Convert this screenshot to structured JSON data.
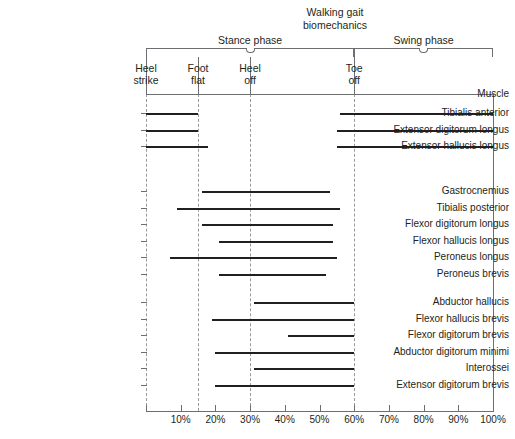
{
  "chart_data": {
    "type": "bar",
    "title": "Walking gait\nbiomechanics",
    "xlabel": "",
    "ylabel": "Muscle",
    "xlim": [
      0,
      100
    ],
    "grid": true,
    "legend": "none",
    "orientation": "horizontal-span",
    "xticks": [
      {
        "value": 10,
        "label": "10%"
      },
      {
        "value": 20,
        "label": "20%"
      },
      {
        "value": 30,
        "label": "30%"
      },
      {
        "value": 40,
        "label": "40%"
      },
      {
        "value": 50,
        "label": "50%"
      },
      {
        "value": 60,
        "label": "60%"
      },
      {
        "value": 70,
        "label": "70%"
      },
      {
        "value": 80,
        "label": "80%"
      },
      {
        "value": 90,
        "label": "90%"
      },
      {
        "value": 100,
        "label": "100%"
      }
    ],
    "phases": [
      {
        "name": "Stance phase",
        "start": 0,
        "end": 60
      },
      {
        "name": "Swing phase",
        "start": 60,
        "end": 100
      }
    ],
    "events": [
      {
        "name": "Heel\nstrike",
        "value": 0
      },
      {
        "name": "Foot\nflat",
        "value": 15
      },
      {
        "name": "Heel\noff",
        "value": 30
      },
      {
        "name": "Toe\noff",
        "value": 60
      }
    ],
    "categories": [
      "Tibialis anterior",
      "Extensor digitorum longus",
      "Extensor hallucis longus",
      "Gastrocnemius",
      "Tibialis posterior",
      "Flexor digitorum longus",
      "Flexor hallucis longus",
      "Peroneus longus",
      "Peroneus brevis",
      "Abductor hallucis",
      "Flexor hallucis brevis",
      "Flexor digitorum brevis",
      "Abductor digitorum minimi",
      "Interossei",
      "Extensor digitorum brevis"
    ],
    "groups": [
      {
        "name": "anterior-compartment",
        "rows": [
          {
            "label": "Tibialis anterior",
            "spans": [
              [
                0,
                15
              ],
              [
                56,
                100
              ]
            ]
          },
          {
            "label": "Extensor digitorum longus",
            "spans": [
              [
                0,
                15
              ],
              [
                55,
                100
              ]
            ]
          },
          {
            "label": "Extensor hallucis longus",
            "spans": [
              [
                0,
                18
              ],
              [
                55,
                100
              ]
            ]
          }
        ]
      },
      {
        "name": "posterior-lateral-compartment",
        "rows": [
          {
            "label": "Gastrocnemius",
            "spans": [
              [
                16,
                53
              ]
            ]
          },
          {
            "label": "Tibialis posterior",
            "spans": [
              [
                9,
                56
              ]
            ]
          },
          {
            "label": "Flexor digitorum longus",
            "spans": [
              [
                16,
                54
              ]
            ]
          },
          {
            "label": "Flexor hallucis longus",
            "spans": [
              [
                21,
                54
              ]
            ]
          },
          {
            "label": "Peroneus longus",
            "spans": [
              [
                7,
                55
              ]
            ]
          },
          {
            "label": "Peroneus brevis",
            "spans": [
              [
                21,
                52
              ]
            ]
          }
        ]
      },
      {
        "name": "intrinsic-foot-muscles",
        "rows": [
          {
            "label": "Abductor hallucis",
            "spans": [
              [
                31,
                60
              ]
            ]
          },
          {
            "label": "Flexor hallucis brevis",
            "spans": [
              [
                19,
                60
              ]
            ]
          },
          {
            "label": "Flexor digitorum brevis",
            "spans": [
              [
                41,
                60
              ]
            ]
          },
          {
            "label": "Abductor digitorum minimi",
            "spans": [
              [
                20,
                60
              ]
            ]
          },
          {
            "label": "Interossei",
            "spans": [
              [
                31,
                60
              ]
            ]
          },
          {
            "label": "Extensor digitorum brevis",
            "spans": [
              [
                20,
                60
              ]
            ]
          }
        ]
      }
    ],
    "colors": {
      "bar": "#231f20",
      "axis": "#6d6e71",
      "gridline": "#9a9a9a",
      "text": "#231f20",
      "background": "#ffffff"
    }
  },
  "header": {
    "muscle_column_label": "Muscle"
  }
}
